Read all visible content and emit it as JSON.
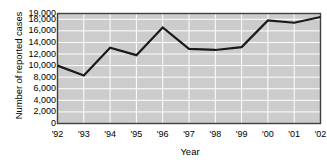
{
  "chart_data": {
    "type": "line",
    "title": "",
    "xlabel": "Year",
    "ylabel": "Number of reported cases",
    "categories": [
      "'92",
      "'93",
      "'94",
      "'95",
      "'96",
      "'97",
      "'98",
      "'99",
      "'00",
      "'01",
      "'02"
    ],
    "values": [
      10000,
      8300,
      13100,
      11800,
      16600,
      12900,
      12700,
      13200,
      17800,
      17400,
      18400
    ],
    "series": [
      {
        "name": "Number of reported cases",
        "values": [
          10000,
          8300,
          13100,
          11800,
          16600,
          12900,
          12700,
          13200,
          17800,
          17400,
          18400
        ]
      }
    ],
    "ylim": [
      0,
      19000
    ],
    "yticks": [
      0,
      2000,
      4000,
      6000,
      8000,
      10000,
      12000,
      14000,
      16000,
      18000,
      19000
    ],
    "ytick_labels": [
      "0",
      "2,000",
      "4,000",
      "6,000",
      "8,000",
      "10,000",
      "12,000",
      "14,000",
      "16,000",
      "18,000",
      "19,000"
    ],
    "grid": true,
    "grid_color": "#ffffff",
    "plot_background": "#cccccc",
    "line_color": "#1a1a1a",
    "axis_color": "#404040",
    "legend": "none",
    "legend_position": "none"
  },
  "axis_titles": {
    "x": "Year",
    "y": "Number of reported cases"
  }
}
